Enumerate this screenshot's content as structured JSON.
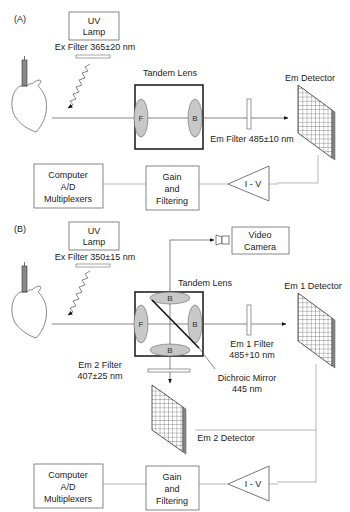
{
  "panel_a": {
    "label": "(A)",
    "uv_lamp": [
      "UV",
      "Lamp"
    ],
    "ex_filter": "Ex Filter 365±20 nm",
    "tandem_lens": "Tandem Lens",
    "lens_front": "F",
    "lens_back": "B",
    "em_filter": "Em Filter 485±10 nm",
    "em_detector": "Em Detector",
    "computer": [
      "Computer",
      "A/D",
      "Multiplexers"
    ],
    "gain": [
      "Gain",
      "and",
      "Filtering"
    ],
    "amplifier": "I - V"
  },
  "panel_b": {
    "label": "(B)",
    "uv_lamp": [
      "UV",
      "Lamp"
    ],
    "ex_filter": "Ex Filter 350±15 nm",
    "video_camera": [
      "Video",
      "Camera"
    ],
    "tandem_lens": "Tandem Lens",
    "lens_front": "F",
    "lens_back_top": "B",
    "lens_back_right": "B",
    "lens_back_bottom": "B",
    "em1_detector": "Em 1 Detector",
    "em1_filter": [
      "Em 1 Filter",
      "485+10 nm"
    ],
    "em2_filter": [
      "Em 2 Filter",
      "407±25 nm"
    ],
    "dichroic_mirror": [
      "Dichroic Mirror",
      "445 nm"
    ],
    "em2_detector": "Em 2 Detector",
    "computer": [
      "Computer",
      "A/D",
      "Multiplexers"
    ],
    "gain": [
      "Gain",
      "and",
      "Filtering"
    ],
    "amplifier": "I - V"
  }
}
